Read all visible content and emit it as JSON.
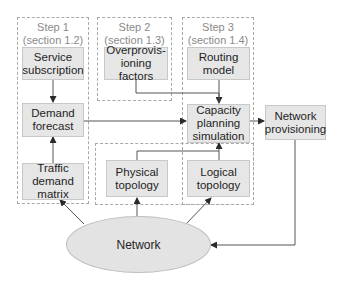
{
  "diagram": {
    "groups": [
      {
        "id": "step1",
        "title": "Step 1",
        "subtitle": "(section 1.2)"
      },
      {
        "id": "step2",
        "title": "Step 2",
        "subtitle": "(section 1.3)"
      },
      {
        "id": "step3",
        "title": "Step 3",
        "subtitle": "(section 1.4)"
      },
      {
        "id": "topology",
        "title": "",
        "subtitle": ""
      }
    ],
    "nodes": {
      "service_subscription": "Service\nsubscription",
      "demand_forecast": "Demand\nforecast",
      "traffic_demand_matrix": "Traffic\ndemand\nmatrix",
      "overprovisioning_factors": "Overprovis-\nioning factors",
      "routing_model": "Routing\nmodel",
      "capacity_planning_simulation": "Capacity\nplanning\nsimulation",
      "network_provisioning": "Network\nprovisioning",
      "physical_topology": "Physical\ntopology",
      "logical_topology": "Logical\ntopology",
      "network": "Network"
    },
    "edges": [
      {
        "from": "service_subscription",
        "to": "demand_forecast"
      },
      {
        "from": "traffic_demand_matrix",
        "to": "demand_forecast"
      },
      {
        "from": "demand_forecast",
        "to": "capacity_planning_simulation"
      },
      {
        "from": "overprovisioning_factors",
        "to": "capacity_planning_simulation"
      },
      {
        "from": "routing_model",
        "to": "capacity_planning_simulation"
      },
      {
        "from": "physical_topology",
        "to": "capacity_planning_simulation"
      },
      {
        "from": "logical_topology",
        "to": "capacity_planning_simulation"
      },
      {
        "from": "capacity_planning_simulation",
        "to": "network_provisioning"
      },
      {
        "from": "network_provisioning",
        "to": "network"
      },
      {
        "from": "network",
        "to": "traffic_demand_matrix"
      },
      {
        "from": "network",
        "to": "physical_topology"
      },
      {
        "from": "network",
        "to": "logical_topology"
      }
    ],
    "colors": {
      "node_fill": "#e6e6e6",
      "node_border": "#c8c8c8",
      "group_border": "#a8a8a8",
      "group_label": "#8a8a8a",
      "arrow": "#555555"
    }
  }
}
